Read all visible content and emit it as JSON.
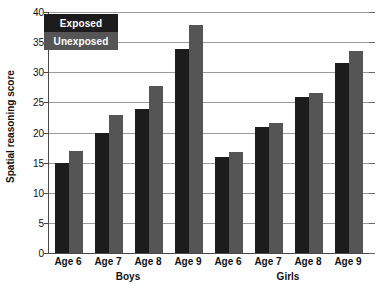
{
  "chart_data": {
    "type": "bar",
    "title": "",
    "xlabel": "",
    "ylabel": "Spatial reasoning score",
    "ylim": [
      0,
      40
    ],
    "ytick_step": 5,
    "yticks": [
      0,
      5,
      10,
      15,
      20,
      25,
      30,
      35,
      40
    ],
    "grid": true,
    "legend_position": "top-left",
    "categories": [
      "Age 6",
      "Age 7",
      "Age 8",
      "Age 9",
      "Age 6",
      "Age 7",
      "Age 8",
      "Age 9"
    ],
    "groups": [
      {
        "name": "Boys",
        "categories": [
          "Age 6",
          "Age 7",
          "Age 8",
          "Age 9"
        ]
      },
      {
        "name": "Girls",
        "categories": [
          "Age 6",
          "Age 7",
          "Age 8",
          "Age 9"
        ]
      }
    ],
    "series": [
      {
        "name": "Exposed",
        "color": "#1c1c1c",
        "values": [
          15.0,
          19.9,
          23.9,
          33.9,
          15.9,
          20.9,
          25.9,
          31.6
        ]
      },
      {
        "name": "Unexposed",
        "color": "#555555",
        "values": [
          16.9,
          22.9,
          27.8,
          37.8,
          16.7,
          21.6,
          26.5,
          33.5
        ]
      }
    ]
  },
  "legend": {
    "items": [
      {
        "label": "Exposed",
        "swatch": "#1c1c1c"
      },
      {
        "label": "Unexposed",
        "swatch": "#555555"
      }
    ]
  },
  "axis": {
    "y_title": "Spatial reasoning score",
    "y_labels": [
      "40",
      "35",
      "30",
      "25",
      "20",
      "15",
      "10",
      "5",
      "0"
    ],
    "group_labels": [
      "Boys",
      "Girls"
    ]
  }
}
